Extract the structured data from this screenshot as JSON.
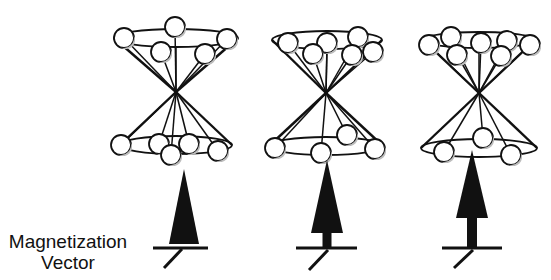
{
  "figure": {
    "label_line1": "Magnetization",
    "label_line2": "Vector",
    "colors": {
      "stroke": "#111111",
      "background": "#ffffff",
      "sphere_shade": "#bdbdbd",
      "sphere_fill": "#ffffff"
    }
  },
  "cones": [
    {
      "name": "cone-1",
      "apex": [
        176,
        92
      ],
      "top_ellipse": {
        "cx": 176,
        "cy": 38,
        "rx": 62,
        "ry": 9
      },
      "bottom_ellipse": {
        "cx": 176,
        "cy": 145,
        "rx": 56,
        "ry": 9
      },
      "top_spheres": [
        [
          124,
          38
        ],
        [
          175,
          27
        ],
        [
          227,
          39
        ],
        [
          161,
          52
        ],
        [
          205,
          54
        ]
      ],
      "bottom_spheres": [
        [
          121,
          145
        ],
        [
          159,
          144
        ],
        [
          189,
          144
        ],
        [
          171,
          155
        ],
        [
          218,
          151
        ]
      ],
      "vector": {
        "apex": [
          184,
          169
        ],
        "tri_base_y": 244,
        "tri_half_width": 15,
        "stem_top": 244,
        "stem_width": 0,
        "base_y": 248,
        "base_x1": 153,
        "base_x2": 208,
        "diag_from": [
          182,
          249
        ],
        "diag_to": [
          164,
          268
        ]
      }
    },
    {
      "name": "cone-2",
      "apex": [
        326,
        93
      ],
      "top_ellipse": {
        "cx": 327,
        "cy": 40,
        "rx": 55,
        "ry": 9
      },
      "bottom_ellipse": {
        "cx": 326,
        "cy": 146,
        "rx": 57,
        "ry": 9
      },
      "top_spheres": [
        [
          288,
          43
        ],
        [
          327,
          43
        ],
        [
          358,
          37
        ],
        [
          313,
          54
        ],
        [
          352,
          55
        ],
        [
          373,
          52
        ]
      ],
      "bottom_spheres": [
        [
          275,
          148
        ],
        [
          321,
          153
        ],
        [
          347,
          135
        ],
        [
          375,
          149
        ]
      ],
      "vector": {
        "apex": [
          327,
          160
        ],
        "tri_base_y": 233,
        "tri_half_width": 16,
        "stem_top": 233,
        "stem_width": 9,
        "base_y": 248,
        "base_x1": 296,
        "base_x2": 357,
        "diag_from": [
          328,
          250
        ],
        "diag_to": [
          309,
          270
        ]
      }
    },
    {
      "name": "cone-3",
      "apex": [
        479,
        93
      ],
      "top_ellipse": {
        "cx": 479,
        "cy": 40,
        "rx": 56,
        "ry": 8
      },
      "bottom_ellipse": {
        "cx": 479,
        "cy": 148,
        "rx": 58,
        "ry": 9
      },
      "top_spheres": [
        [
          429,
          45
        ],
        [
          451,
          37
        ],
        [
          481,
          43
        ],
        [
          507,
          41
        ],
        [
          530,
          45
        ],
        [
          457,
          55
        ],
        [
          501,
          56
        ]
      ],
      "bottom_spheres": [
        [
          444,
          152
        ],
        [
          483,
          138
        ],
        [
          511,
          155
        ]
      ],
      "vector": {
        "apex": [
          472,
          150
        ],
        "tri_base_y": 218,
        "tri_half_width": 16,
        "stem_top": 218,
        "stem_width": 10,
        "base_y": 248,
        "base_x1": 442,
        "base_x2": 502,
        "diag_from": [
          473,
          250
        ],
        "diag_to": [
          454,
          268
        ]
      }
    }
  ],
  "sphere_radius": 10
}
